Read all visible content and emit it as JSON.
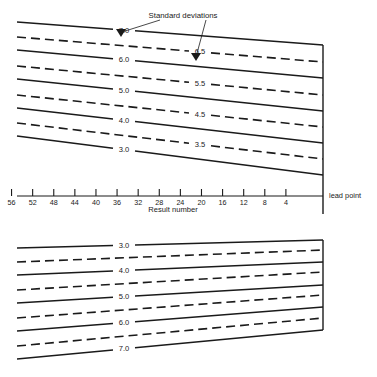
{
  "figure": {
    "annotation": {
      "standard_deviations_label": "Standard deviations"
    },
    "axis": {
      "title": "Result number",
      "tick_labels": [
        "56",
        "52",
        "48",
        "44",
        "40",
        "36",
        "32",
        "28",
        "24",
        "20",
        "16",
        "12",
        "8",
        "4"
      ],
      "tick_values": [
        56,
        52,
        48,
        44,
        40,
        36,
        32,
        28,
        24,
        20,
        16,
        12,
        8,
        4
      ],
      "lead_point_label": "lead point"
    },
    "upper_chart": {
      "solid_labels": [
        "7.0",
        "6.0",
        "5.0",
        "4.0",
        "3.0"
      ],
      "dashed_labels": [
        "6.5",
        "5.5",
        "4.5",
        "3.5"
      ]
    },
    "lower_chart": {
      "solid_labels": [
        "3.0",
        "4.0",
        "5.0",
        "6.0",
        "7.0"
      ],
      "dashed_labels": [
        "",
        "",
        "",
        ""
      ]
    },
    "colors": {
      "ink": "#1a1a1a",
      "paper": "#ffffff"
    }
  },
  "chart_data": {
    "type": "line",
    "title": "",
    "subtitle": "",
    "xlabel": "Result number",
    "ylabel": "",
    "annotations": [
      "Standard deviations",
      "lead point"
    ],
    "grid": false,
    "legend": "none",
    "x_axis": {
      "tick_labels": [
        "56",
        "52",
        "48",
        "44",
        "40",
        "36",
        "32",
        "28",
        "24",
        "20",
        "16",
        "12",
        "8",
        "4"
      ],
      "tick_values": [
        56,
        52,
        48,
        44,
        40,
        36,
        32,
        28,
        24,
        20,
        16,
        12,
        8,
        4
      ],
      "direction": "decreasing-left-to-right",
      "xlim": [
        58,
        0
      ]
    },
    "panels": [
      {
        "name": "upper",
        "description": "Fan of converging control limit lines above the result-number axis; all lines converge toward the lead point on the right.",
        "series": [
          {
            "name": "7.0",
            "style": "solid",
            "label": "7.0",
            "x": [
              58,
              0
            ],
            "y_left": 22,
            "y_right": 45
          },
          {
            "name": "6.5",
            "style": "dashed",
            "label": "6.5",
            "x": [
              58,
              0
            ],
            "y_left": 37,
            "y_right": 62
          },
          {
            "name": "6.0",
            "style": "solid",
            "label": "6.0",
            "x": [
              58,
              0
            ],
            "y_left": 50,
            "y_right": 78
          },
          {
            "name": "5.5",
            "style": "dashed",
            "label": "5.5",
            "x": [
              58,
              0
            ],
            "y_left": 66,
            "y_right": 95
          },
          {
            "name": "5.0",
            "style": "solid",
            "label": "5.0",
            "x": [
              58,
              0
            ],
            "y_left": 79,
            "y_right": 111
          },
          {
            "name": "4.5",
            "style": "dashed",
            "label": "4.5",
            "x": [
              58,
              0
            ],
            "y_left": 95,
            "y_right": 127
          },
          {
            "name": "4.0",
            "style": "solid",
            "label": "4.0",
            "x": [
              58,
              0
            ],
            "y_left": 108,
            "y_right": 143
          },
          {
            "name": "3.5",
            "style": "dashed",
            "label": "3.5",
            "x": [
              58,
              0
            ],
            "y_left": 123,
            "y_right": 159
          },
          {
            "name": "3.0",
            "style": "solid",
            "label": "3.0",
            "x": [
              58,
              0
            ],
            "y_left": 136,
            "y_right": 175
          }
        ]
      },
      {
        "name": "lower",
        "description": "Mirror-image fan of control limit lines below the axis; lines converge toward the lead point on the right.",
        "series": [
          {
            "name": "3.0",
            "style": "solid",
            "label": "3.0",
            "x": [
              58,
              0
            ],
            "y_left": 248,
            "y_right": 240
          },
          {
            "name": "3.5",
            "style": "dashed",
            "label": "",
            "x": [
              58,
              0
            ],
            "y_left": 262,
            "y_right": 250
          },
          {
            "name": "4.0",
            "style": "solid",
            "label": "4.0",
            "x": [
              58,
              0
            ],
            "y_left": 275,
            "y_right": 262
          },
          {
            "name": "4.5",
            "style": "dashed",
            "label": "",
            "x": [
              58,
              0
            ],
            "y_left": 290,
            "y_right": 272
          },
          {
            "name": "5.0",
            "style": "solid",
            "label": "5.0",
            "x": [
              58,
              0
            ],
            "y_left": 303,
            "y_right": 285
          },
          {
            "name": "5.5",
            "style": "dashed",
            "label": "",
            "x": [
              58,
              0
            ],
            "y_left": 318,
            "y_right": 295
          },
          {
            "name": "6.0",
            "style": "solid",
            "label": "6.0",
            "x": [
              58,
              0
            ],
            "y_left": 331,
            "y_right": 307
          },
          {
            "name": "6.5",
            "style": "dashed",
            "label": "",
            "x": [
              58,
              0
            ],
            "y_left": 346,
            "y_right": 318
          },
          {
            "name": "7.0",
            "style": "solid",
            "label": "7.0",
            "x": [
              58,
              0
            ],
            "y_left": 359,
            "y_right": 330
          }
        ]
      }
    ]
  }
}
